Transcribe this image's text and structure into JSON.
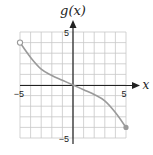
{
  "chart_data": {
    "type": "line",
    "title": "",
    "xlabel": "x",
    "ylabel": "g(x)",
    "xlim": [
      -5,
      5
    ],
    "ylim": [
      -5,
      5
    ],
    "grid": true,
    "grid_step": 1,
    "x_tick_labels": [
      {
        "value": -5,
        "label": "−5"
      },
      {
        "value": 5,
        "label": "5"
      }
    ],
    "y_tick_labels": [
      {
        "value": 5,
        "label": "5"
      },
      {
        "value": -5,
        "label": "−5"
      }
    ],
    "series": [
      {
        "name": "g(x)",
        "x": [
          -5,
          -4,
          -3,
          -2,
          -1,
          0,
          1,
          2,
          3,
          4,
          5
        ],
        "values": [
          4,
          2.6,
          1.5,
          0.9,
          0.45,
          0,
          -0.45,
          -0.9,
          -1.5,
          -2.6,
          -4
        ],
        "color": "#9a9a9a"
      }
    ],
    "endpoints": [
      {
        "x": -5,
        "y": 4,
        "style": "open"
      },
      {
        "x": 5,
        "y": -4,
        "style": "closed"
      }
    ],
    "legend": null
  },
  "labels": {
    "y_axis": "g(x)",
    "x_axis": "x",
    "x_min": "−5",
    "x_max": "5",
    "y_max": "5",
    "y_min": "−5"
  },
  "colors": {
    "grid": "#c8c8c8",
    "axis": "#222222",
    "curve": "#9a9a9a"
  }
}
